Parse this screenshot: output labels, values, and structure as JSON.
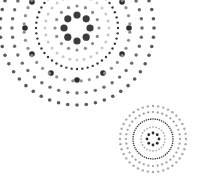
{
  "graphic": {
    "description": "decorative concentric dot mandala pattern",
    "colors": {
      "dark": "#3a3a3a",
      "mid": "#6e6e6e",
      "light": "#9a9a9a",
      "pale": "#c4c4c4",
      "background": "#ffffff"
    },
    "clusters": [
      {
        "name": "large-mandala",
        "cx": 77,
        "cy": 28,
        "rings": [
          {
            "r": 13,
            "n": 8,
            "size": 3.6,
            "color": "#3c3c3c"
          },
          {
            "r": 22,
            "n": 16,
            "size": 1.6,
            "color": "#8a8a8a"
          },
          {
            "r": 32,
            "n": 28,
            "size": 1.5,
            "color": "#c8c8c8"
          },
          {
            "r": 41,
            "n": 48,
            "size": 1.2,
            "color": "#3a3a3a"
          },
          {
            "r": 52,
            "n": 12,
            "size": 2.8,
            "color": "#2e2e2e"
          },
          {
            "r": 53,
            "n": 40,
            "size": 1.6,
            "color": "#8e8e8e",
            "offset": 4.5
          },
          {
            "r": 65,
            "n": 44,
            "size": 1.7,
            "color": "#6a6a6a"
          },
          {
            "r": 77,
            "n": 52,
            "size": 1.8,
            "color": "#5a5a5a"
          }
        ]
      },
      {
        "name": "small-mandala",
        "cx": 153,
        "cy": 139,
        "rings": [
          {
            "r": 6,
            "n": 8,
            "size": 1.4,
            "color": "#2e2e2e"
          },
          {
            "r": 12,
            "n": 24,
            "size": 0.9,
            "color": "#b0b0b0"
          },
          {
            "r": 20,
            "n": 56,
            "size": 0.8,
            "color": "#3a3a3a"
          },
          {
            "r": 27,
            "n": 36,
            "size": 1.1,
            "color": "#9a9a9a"
          },
          {
            "r": 33,
            "n": 40,
            "size": 1.2,
            "color": "#a8a8a8"
          }
        ]
      }
    ]
  }
}
